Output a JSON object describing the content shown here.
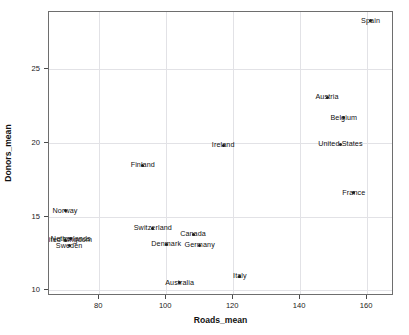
{
  "chart_data": {
    "type": "scatter",
    "title": "",
    "xlabel": "Roads_mean",
    "ylabel": "Donors_mean",
    "xlim": [
      65.0,
      168.0
    ],
    "ylim": [
      9.6,
      28.9
    ],
    "xticks": [
      80,
      100,
      120,
      140,
      160
    ],
    "xtick_labels": [
      "80",
      "100",
      "120",
      "140",
      "160"
    ],
    "yticks": [
      10,
      15,
      20,
      25
    ],
    "ytick_labels": [
      "10",
      "15",
      "20",
      "25"
    ],
    "grid": true,
    "grid_color": "#e2e2e6",
    "legend": "none",
    "marker_color": "#222222",
    "label_color": "#111111",
    "points": [
      {
        "label": "Spain",
        "x": 161.0,
        "y": 28.3,
        "dx": 0,
        "dy": 0
      },
      {
        "label": "Austria",
        "x": 148.0,
        "y": 23.1,
        "dx": 0,
        "dy": 0
      },
      {
        "label": "Belgium",
        "x": 153.0,
        "y": 21.7,
        "dx": 0,
        "dy": 0
      },
      {
        "label": "United States",
        "x": 152.0,
        "y": 19.9,
        "dx": 0,
        "dy": 0
      },
      {
        "label": "Ireland",
        "x": 117.0,
        "y": 19.85,
        "dx": 0,
        "dy": 0
      },
      {
        "label": "Finland",
        "x": 93.0,
        "y": 18.5,
        "dx": 0,
        "dy": 0
      },
      {
        "label": "France",
        "x": 156.0,
        "y": 16.6,
        "dx": 0,
        "dy": 0
      },
      {
        "label": "Norway",
        "x": 69.8,
        "y": 15.4,
        "dx": 0,
        "dy": 0
      },
      {
        "label": "Switzerland",
        "x": 96.0,
        "y": 14.2,
        "dx": 0,
        "dy": 0
      },
      {
        "label": "Canada",
        "x": 108.0,
        "y": 13.8,
        "dx": 0,
        "dy": 0
      },
      {
        "label": "Netherlands",
        "x": 71.5,
        "y": 13.5,
        "dx": 0,
        "dy": 0
      },
      {
        "label": "United Kingdom",
        "x": 70.0,
        "y": 13.4,
        "dx": 0,
        "dy": 0
      },
      {
        "label": "Denmark",
        "x": 100.0,
        "y": 13.1,
        "dx": 0,
        "dy": 0
      },
      {
        "label": "Germany",
        "x": 110.0,
        "y": 13.05,
        "dx": 0,
        "dy": 0
      },
      {
        "label": "Sweden",
        "x": 71.0,
        "y": 13.0,
        "dx": 0,
        "dy": 0
      },
      {
        "label": "Italy",
        "x": 122.0,
        "y": 10.95,
        "dx": 0,
        "dy": 0
      },
      {
        "label": "Australia",
        "x": 104.0,
        "y": 10.5,
        "dx": 0,
        "dy": 0
      }
    ]
  }
}
